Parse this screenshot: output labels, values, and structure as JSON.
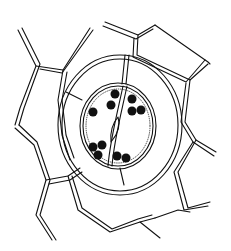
{
  "figure": {
    "labels": [],
    "parts": {
      "guard_cells": 2,
      "chloroplasts_visible": 11,
      "stomatal_pore": 1
    },
    "colors": {
      "line": "#111111",
      "background": "#ffffff",
      "chloroplast": "#111111"
    }
  }
}
